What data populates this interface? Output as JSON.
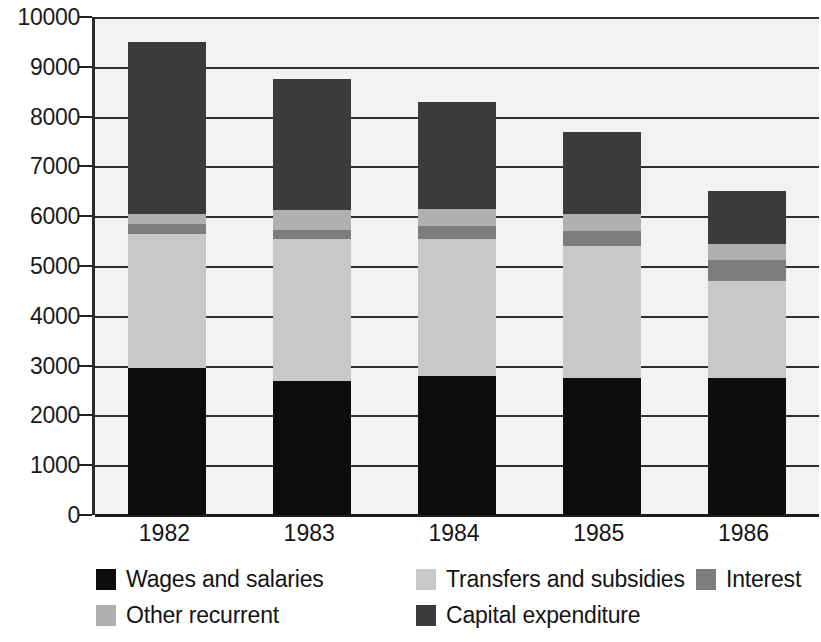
{
  "chart_data": {
    "type": "bar",
    "subtype": "stacked-bar",
    "title": "",
    "xlabel": "",
    "ylabel": "",
    "categories": [
      "1982",
      "1983",
      "1984",
      "1985",
      "1986"
    ],
    "ylim": [
      0,
      10000
    ],
    "y_ticks": [
      0,
      1000,
      2000,
      3000,
      4000,
      5000,
      6000,
      7000,
      8000,
      9000,
      10000
    ],
    "y_tick_labels": [
      "0",
      "1000",
      "2000",
      "3000",
      "4000",
      "5000",
      "6000",
      "7000",
      "8000",
      "9000",
      "10000"
    ],
    "grid": true,
    "legend_position": "bottom",
    "series": [
      {
        "name": "Wages and salaries",
        "color": "#0d0d0d",
        "values": [
          2950,
          2700,
          2800,
          2750,
          2750
        ]
      },
      {
        "name": "Transfers and subsidies",
        "color": "#c8c8c8",
        "values": [
          2700,
          2850,
          2750,
          2650,
          1950
        ]
      },
      {
        "name": "Interest",
        "color": "#7d7d7d",
        "values": [
          200,
          180,
          250,
          300,
          420
        ]
      },
      {
        "name": "Other recurrent",
        "color": "#b0b0b0",
        "values": [
          200,
          400,
          350,
          350,
          330
        ]
      },
      {
        "name": "Capital expenditure",
        "color": "#3b3b3b",
        "values": [
          3450,
          2620,
          2150,
          1650,
          1050
        ]
      }
    ],
    "totals": [
      9500,
      8750,
      8300,
      7700,
      6500
    ],
    "stack_order": [
      "Wages and salaries",
      "Transfers and subsidies",
      "Interest",
      "Other recurrent",
      "Capital expenditure"
    ],
    "plot_background": "#f2f2f2"
  },
  "legend": {
    "items": [
      {
        "label": "Wages and salaries",
        "color": "#0d0d0d"
      },
      {
        "label": "Transfers and subsidies",
        "color": "#c8c8c8"
      },
      {
        "label": "Interest",
        "color": "#7d7d7d"
      },
      {
        "label": "Other recurrent",
        "color": "#b0b0b0"
      },
      {
        "label": "Capital expenditure",
        "color": "#3b3b3b"
      }
    ]
  }
}
